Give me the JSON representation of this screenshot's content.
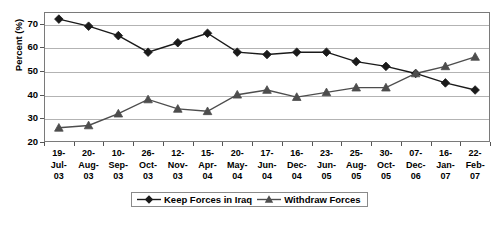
{
  "chart_data": {
    "type": "line",
    "title": "",
    "xlabel": "",
    "ylabel": "Percent (%)",
    "ylim": [
      20,
      75
    ],
    "yticks": [
      20,
      30,
      40,
      50,
      60,
      70
    ],
    "grid": true,
    "legend_position": "bottom-center",
    "categories": [
      "19-Jul-03",
      "20-Aug-03",
      "10-Sep-03",
      "26-Oct-03",
      "12-Nov-03",
      "15-Apr-04",
      "20-May-04",
      "17-Jun-04",
      "16-Dec-04",
      "23-Jun-05",
      "25-Aug-05",
      "30-Oct-05",
      "07-Dec-06",
      "16-Jan-07",
      "22-Feb-07"
    ],
    "category_lines": [
      [
        "19-",
        "Jul-",
        "03"
      ],
      [
        "20-",
        "Aug-",
        "03"
      ],
      [
        "10-",
        "Sep-",
        "03"
      ],
      [
        "26-",
        "Oct-",
        "03"
      ],
      [
        "12-",
        "Nov-",
        "03"
      ],
      [
        "15-",
        "Apr-",
        "04"
      ],
      [
        "20-",
        "May-",
        "04"
      ],
      [
        "17-",
        "Jun-",
        "04"
      ],
      [
        "16-",
        "Dec-",
        "04"
      ],
      [
        "23-",
        "Jun-",
        "05"
      ],
      [
        "25-",
        "Aug-",
        "05"
      ],
      [
        "30-",
        "Oct-",
        "05"
      ],
      [
        "07-",
        "Dec-",
        "06"
      ],
      [
        "16-",
        "Jan-",
        "07"
      ],
      [
        "22-",
        "Feb-",
        "07"
      ]
    ],
    "series": [
      {
        "name": "Keep Forces in Iraq",
        "marker": "diamond",
        "color": "#1a1a1a",
        "values": [
          72,
          69,
          65,
          58,
          62,
          66,
          58,
          57,
          58,
          58,
          54,
          52,
          49,
          45,
          42
        ]
      },
      {
        "name": "Withdraw Forces",
        "marker": "triangle",
        "color": "#4d4d4d",
        "values": [
          26,
          27,
          32,
          38,
          34,
          33,
          40,
          42,
          39,
          41,
          43,
          43,
          49,
          52,
          56
        ]
      }
    ]
  },
  "legend": {
    "entries": [
      {
        "label": "Keep Forces in Iraq",
        "marker": "diamond"
      },
      {
        "label": "Withdraw Forces",
        "marker": "triangle"
      }
    ]
  },
  "axis": {
    "y_title": "Percent (%)",
    "y_tick_labels": [
      "70",
      "60",
      "50",
      "40",
      "30",
      "20"
    ]
  }
}
